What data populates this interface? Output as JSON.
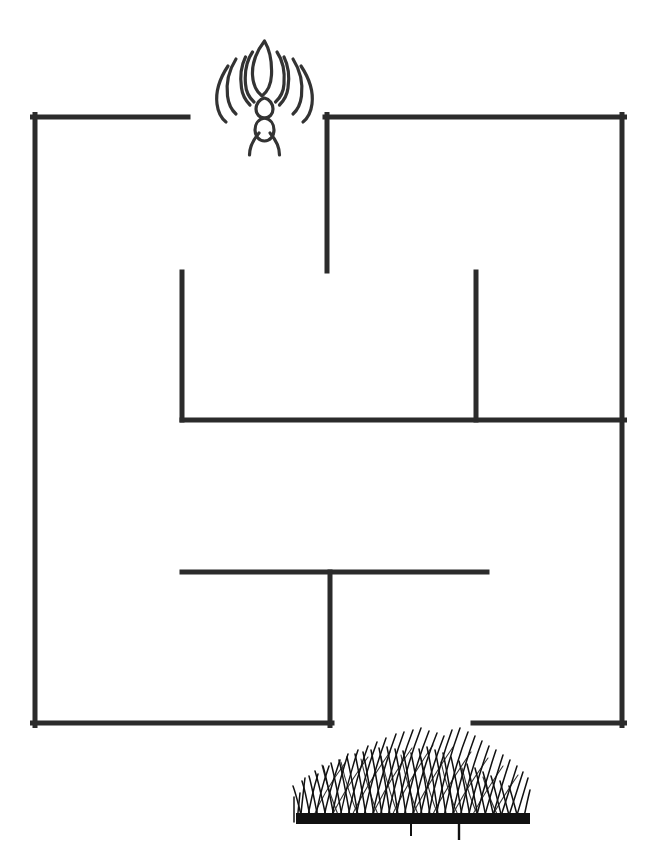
{
  "page": {
    "title": "Ant Maze Puzzle Worksheet",
    "background_color": "#ffffff",
    "width": 657,
    "height": 851
  },
  "maze": {
    "label": "Maze",
    "wall_color": "#2b2b2b",
    "wall_thickness": 5,
    "bounds": {
      "left": 35,
      "top": 117,
      "right": 622,
      "bottom": 723
    },
    "entrance": {
      "label": "Top entrance gap",
      "x_from": 188,
      "x_to": 325,
      "y": 117
    },
    "exit": {
      "label": "Bottom exit gap",
      "x_from": 332,
      "x_to": 473,
      "y": 723
    },
    "walls": [
      {
        "name": "outer-left-wall",
        "orientation": "vertical",
        "x1": 35,
        "y1": 117,
        "x2": 35,
        "y2": 723
      },
      {
        "name": "outer-top-left-wall",
        "orientation": "horizontal",
        "x1": 35,
        "y1": 117,
        "x2": 188,
        "y2": 117
      },
      {
        "name": "outer-top-right-wall",
        "orientation": "horizontal",
        "x1": 325,
        "y1": 117,
        "x2": 622,
        "y2": 117
      },
      {
        "name": "outer-right-wall",
        "orientation": "vertical",
        "x1": 622,
        "y1": 117,
        "x2": 622,
        "y2": 723
      },
      {
        "name": "outer-bottom-left-wall",
        "orientation": "horizontal",
        "x1": 35,
        "y1": 723,
        "x2": 332,
        "y2": 723
      },
      {
        "name": "outer-bottom-right-wall",
        "orientation": "horizontal",
        "x1": 473,
        "y1": 723,
        "x2": 622,
        "y2": 723
      },
      {
        "name": "inner-wall-upper-center-vertical",
        "orientation": "vertical",
        "x1": 327,
        "y1": 117,
        "x2": 327,
        "y2": 271
      },
      {
        "name": "inner-wall-left-stub-vertical",
        "orientation": "vertical",
        "x1": 182,
        "y1": 272,
        "x2": 182,
        "y2": 420
      },
      {
        "name": "inner-wall-right-stub-vertical",
        "orientation": "vertical",
        "x1": 476,
        "y1": 272,
        "x2": 476,
        "y2": 420
      },
      {
        "name": "inner-wall-mid-horizontal",
        "orientation": "horizontal",
        "x1": 182,
        "y1": 420,
        "x2": 622,
        "y2": 420
      },
      {
        "name": "inner-wall-lower-horizontal",
        "orientation": "horizontal",
        "x1": 182,
        "y1": 572,
        "x2": 487,
        "y2": 572
      },
      {
        "name": "inner-wall-lower-center-vertical",
        "orientation": "vertical",
        "x1": 330,
        "y1": 572,
        "x2": 330,
        "y2": 723
      }
    ]
  },
  "ant": {
    "label": "Ant",
    "icon_name": "ant-icon",
    "position": {
      "x": 224,
      "y": 30,
      "width": 80,
      "height": 125
    },
    "outline_color": "#333333",
    "stroke_width": 3.2,
    "role": "maze start marker"
  },
  "grass": {
    "label": "Grass",
    "icon_name": "grass-icon",
    "position": {
      "x": 294,
      "y": 734,
      "width": 236,
      "height": 95
    },
    "color": "#111111",
    "role": "maze goal marker"
  }
}
